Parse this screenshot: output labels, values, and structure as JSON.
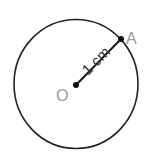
{
  "diagram": {
    "circle": {
      "cx": 76,
      "cy": 84,
      "rx": 62,
      "ry": 64.5,
      "stroke": "#222222"
    },
    "center": {
      "label": "O",
      "x": 76,
      "y": 85
    },
    "point_a": {
      "label": "A",
      "x": 121,
      "y": 39
    },
    "radius_label": "1 cm",
    "colors": {
      "line": "#1a1a1a",
      "label": "#999999",
      "text": "#333333"
    }
  }
}
